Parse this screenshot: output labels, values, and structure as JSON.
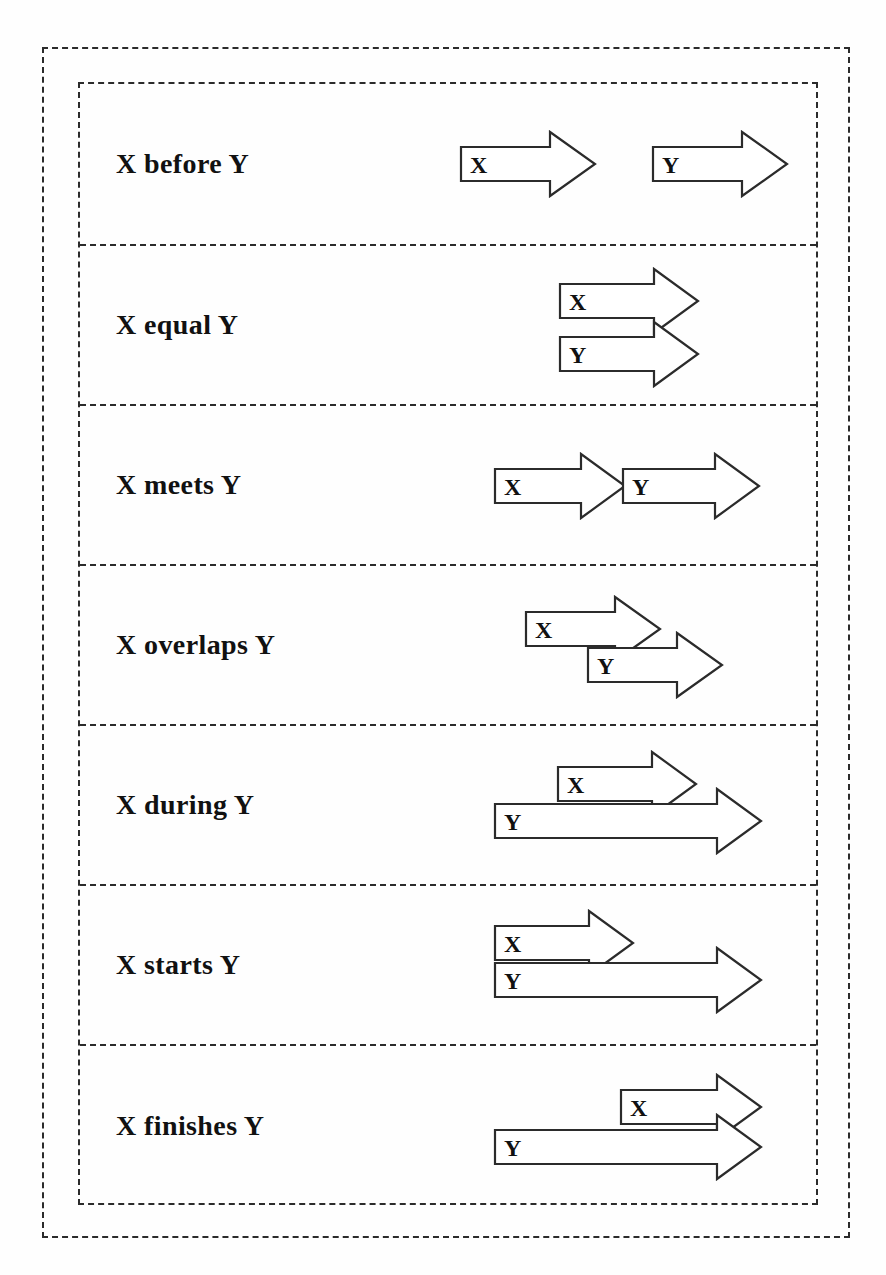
{
  "diagram": {
    "label_x": "X",
    "label_y": "Y",
    "stroke_color": "#2b2b2b",
    "fill_color": "#ffffff",
    "background_color": "#fefefe"
  },
  "rows": [
    {
      "id": "before",
      "label": "X before Y",
      "x_letter": "X",
      "y_letter": "Y",
      "description": "X arrow entirely precedes Y arrow, no overlap"
    },
    {
      "id": "equal",
      "label": "X equal Y",
      "x_letter": "X",
      "y_letter": "Y",
      "description": "X and Y arrows share identical start and end"
    },
    {
      "id": "meets",
      "label": "X meets Y",
      "x_letter": "X",
      "y_letter": "Y",
      "description": "X arrow tip touches the start of Y arrow"
    },
    {
      "id": "overlaps",
      "label": "X overlaps Y",
      "x_letter": "X",
      "y_letter": "Y",
      "description": "X starts first, Y starts before X ends"
    },
    {
      "id": "during",
      "label": "X during Y",
      "x_letter": "X",
      "y_letter": "Y",
      "description": "X arrow is contained inside the span of Y arrow"
    },
    {
      "id": "starts",
      "label": "X starts Y",
      "x_letter": "X",
      "y_letter": "Y",
      "description": "X and Y share the same start, X ends earlier"
    },
    {
      "id": "finishes",
      "label": "X finishes Y",
      "x_letter": "X",
      "y_letter": "Y",
      "description": "X and Y share the same end, X starts later"
    }
  ]
}
